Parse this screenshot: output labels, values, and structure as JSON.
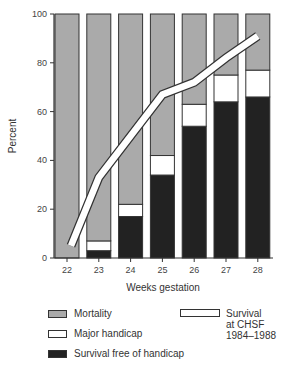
{
  "chart_data": {
    "type": "bar",
    "stacked": true,
    "title": "",
    "xlabel": "Weeks gestation",
    "ylabel": "Percent",
    "ylim": [
      0,
      100
    ],
    "yticks": [
      0,
      20,
      40,
      60,
      80,
      100
    ],
    "categories": [
      "22",
      "23",
      "24",
      "25",
      "26",
      "27",
      "28"
    ],
    "series": [
      {
        "name": "Survival free of handicap",
        "color": "#222222",
        "values": [
          0,
          3,
          17,
          34,
          54,
          64,
          66
        ]
      },
      {
        "name": "Major handicap",
        "color": "#ffffff",
        "values": [
          0,
          4,
          5,
          8,
          9,
          11,
          11
        ]
      },
      {
        "name": "Mortality",
        "color": "#aaaaaa",
        "values": [
          100,
          93,
          78,
          58,
          37,
          25,
          23
        ]
      }
    ],
    "line_series": {
      "name": "Survival at CHSF 1984–1988",
      "type": "line",
      "values": [
        5,
        33,
        50,
        67,
        72,
        82,
        91
      ]
    },
    "legend_position": "bottom",
    "grid": false
  },
  "legend": {
    "mortality": "Mortality",
    "major_handicap": "Major handicap",
    "survival_free": "Survival free of handicap",
    "survival_line_1": "Survival",
    "survival_line_2": "at CHSF",
    "survival_line_3": "1984–1988"
  }
}
